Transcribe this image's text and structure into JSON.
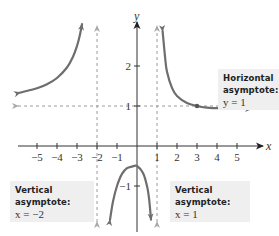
{
  "chart_data": {
    "type": "line",
    "title": "",
    "xlabel": "x",
    "ylabel": "y",
    "xlim": [
      -6,
      6.2
    ],
    "ylim": [
      -2.2,
      3.3
    ],
    "grid": false,
    "x_ticks": [
      -5,
      -4,
      -3,
      -2,
      -1,
      1,
      2,
      3,
      4,
      5
    ],
    "x_tick_labels": [
      "−5",
      "−4",
      "−3",
      "−2",
      "−1",
      "1",
      "2",
      "3",
      "4",
      "5"
    ],
    "y_ticks": [
      2,
      1,
      -1
    ],
    "y_tick_labels": [
      "2",
      "1",
      "−1"
    ],
    "function": "f(x) = (x^2 + 1) / (x^2 + x - 2)",
    "series": [
      {
        "name": "left-branch",
        "x": [
          -5.85,
          -5,
          -4.5,
          -4,
          -3.5,
          -3.2,
          -3,
          -2.85,
          -2.75
        ],
        "y": [
          1.336,
          1.444,
          1.545,
          1.7,
          1.963,
          2.23,
          2.5,
          2.788,
          3.044
        ]
      },
      {
        "name": "middle-branch",
        "x": [
          -1.35,
          -1.2,
          -1,
          -0.75,
          -0.5,
          -0.25,
          0,
          0.3,
          0.5,
          0.6,
          0.7
        ],
        "y": [
          -1.848,
          -1.385,
          -1.0,
          -0.697,
          -0.556,
          -0.515,
          -0.5,
          -0.677,
          -1.0,
          -1.306,
          -1.84
        ]
      },
      {
        "name": "right-branch",
        "x": [
          1.28,
          1.4,
          1.5,
          1.75,
          2,
          2.5,
          3,
          3.5,
          4,
          5,
          5.7
        ],
        "y": [
          2.873,
          2.24,
          1.857,
          1.452,
          1.25,
          1.074,
          1.0,
          0.958,
          0.944,
          0.929,
          0.925
        ]
      }
    ],
    "asymptotes": {
      "vertical": [
        -2,
        1
      ],
      "horizontal": [
        1
      ]
    },
    "highlighted_point": {
      "x": 3,
      "y": 1
    },
    "annotations": [
      {
        "title": "Horizontal asymptote:",
        "equation": "y = 1"
      },
      {
        "title": "Vertical asymptote:",
        "equation": "x = −2"
      },
      {
        "title": "Vertical asymptote:",
        "equation": "x = 1"
      }
    ],
    "colors": {
      "curve": "#6e6e6e",
      "axis": "#333333",
      "asymptote": "#9a9a9a",
      "callout_bg": "#efefef"
    }
  },
  "labels": {
    "x_axis": "x",
    "y_axis": "y",
    "horizontal_callout_title": "Horizontal asymptote:",
    "horizontal_callout_eq": "y = 1",
    "vertical_left_callout_title": "Vertical asymptote:",
    "vertical_left_callout_eq": "x = −2",
    "vertical_right_callout_title": "Vertical asymptote:",
    "vertical_right_callout_eq": "x = 1"
  }
}
